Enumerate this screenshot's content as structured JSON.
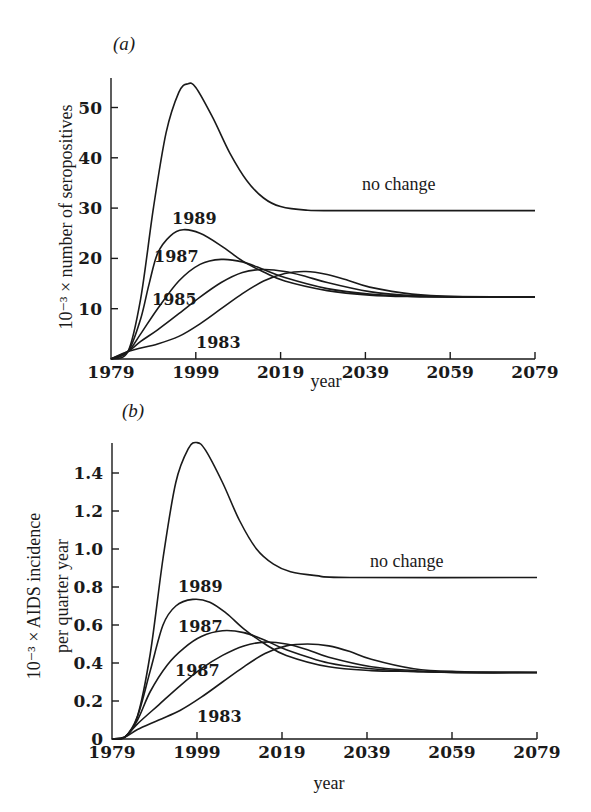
{
  "chart_data": [
    {
      "type": "line",
      "panel": "(a)",
      "title": "",
      "xlabel": "year",
      "ylabel": "10⁻³ × number of seropositives",
      "xlim": [
        1979,
        2079
      ],
      "ylim": [
        0,
        55
      ],
      "xticks": [
        1979,
        1999,
        2019,
        2039,
        2059,
        2079
      ],
      "yticks": [
        10,
        20,
        30,
        40,
        50
      ],
      "ytick_labels": [
        "10",
        "20",
        "30",
        "40",
        "50"
      ],
      "grid": false,
      "series": [
        {
          "name": "no change",
          "label_text": "no change",
          "x": [
            1979,
            1983,
            1986,
            1989,
            1992,
            1995,
            1997,
            1999,
            2003,
            2007,
            2011,
            2015,
            2019,
            2025,
            2035,
            2079
          ],
          "y": [
            0,
            1.5,
            12,
            30,
            45,
            53,
            54.7,
            54,
            48,
            41,
            35.5,
            32,
            30.3,
            29.6,
            29.5,
            29.5
          ]
        },
        {
          "name": "1989",
          "label_text": "1989",
          "x": [
            1979,
            1983,
            1986,
            1988,
            1990,
            1993,
            1996,
            2000,
            2005,
            2010,
            2015,
            2020,
            2030,
            2040,
            2050,
            2060,
            2079
          ],
          "y": [
            0,
            1.5,
            8,
            15,
            21,
            24.5,
            25.7,
            25,
            22.5,
            19.5,
            17.3,
            15.5,
            13.6,
            12.7,
            12.4,
            12.3,
            12.3
          ]
        },
        {
          "name": "1987",
          "label_text": "1987",
          "x": [
            1979,
            1983,
            1986,
            1990,
            1995,
            2000,
            2005,
            2010,
            2015,
            2020,
            2030,
            2040,
            2050,
            2060,
            2079
          ],
          "y": [
            0,
            1.5,
            5,
            10,
            15.5,
            18.8,
            19.8,
            19.3,
            17.8,
            16.2,
            14,
            12.9,
            12.5,
            12.3,
            12.3
          ]
        },
        {
          "name": "1985",
          "label_text": "1985",
          "x": [
            1979,
            1983,
            1986,
            1990,
            1995,
            2000,
            2005,
            2010,
            2015,
            2020,
            2025,
            2030,
            2040,
            2050,
            2060,
            2079
          ],
          "y": [
            0,
            1.5,
            3.5,
            5.8,
            9,
            12.3,
            15.2,
            17.2,
            17.8,
            17.4,
            16.4,
            15.2,
            13.4,
            12.6,
            12.4,
            12.3
          ]
        },
        {
          "name": "1983",
          "label_text": "1983",
          "x": [
            1979,
            1983,
            1990,
            1995,
            2000,
            2005,
            2010,
            2015,
            2020,
            2025,
            2030,
            2035,
            2040,
            2050,
            2060,
            2079
          ],
          "y": [
            0,
            1.5,
            3,
            4.5,
            7,
            10,
            13,
            15.5,
            17,
            17.4,
            16.8,
            15.6,
            14.3,
            12.9,
            12.4,
            12.3
          ]
        }
      ]
    },
    {
      "type": "line",
      "panel": "(b)",
      "title": "",
      "xlabel": "year",
      "ylabel_line1": "10⁻³ × AIDS incidence",
      "ylabel_line2": "per quarter year",
      "xlim": [
        1979,
        2079
      ],
      "ylim": [
        0,
        1.56
      ],
      "xticks": [
        1979,
        1999,
        2019,
        2039,
        2059,
        2079
      ],
      "yticks": [
        0,
        0.2,
        0.4,
        0.6,
        0.8,
        1.0,
        1.2,
        1.4
      ],
      "ytick_labels": [
        "0",
        "0.2",
        "0.4",
        "0.6",
        "0.8",
        "1.0",
        "1.2",
        "1.4"
      ],
      "grid": false,
      "series": [
        {
          "name": "no change",
          "label_text": "no change",
          "x": [
            1979,
            1982,
            1985,
            1988,
            1991,
            1994,
            1997,
            1999,
            2001,
            2005,
            2009,
            2013,
            2017,
            2021,
            2027,
            2035,
            2079
          ],
          "y": [
            0,
            0.01,
            0.12,
            0.45,
            0.95,
            1.35,
            1.53,
            1.56,
            1.52,
            1.35,
            1.15,
            1.0,
            0.92,
            0.88,
            0.86,
            0.85,
            0.85
          ]
        },
        {
          "name": "1989",
          "label_text": "1989",
          "x": [
            1979,
            1982,
            1985,
            1988,
            1991,
            1994,
            1998,
            2002,
            2006,
            2010,
            2015,
            2020,
            2030,
            2040,
            2050,
            2060,
            2079
          ],
          "y": [
            0,
            0.01,
            0.12,
            0.36,
            0.6,
            0.7,
            0.735,
            0.72,
            0.66,
            0.58,
            0.5,
            0.44,
            0.38,
            0.36,
            0.355,
            0.35,
            0.35
          ]
        },
        {
          "name": "1987",
          "label_text": "1987",
          "x": [
            1979,
            1982,
            1985,
            1988,
            1992,
            1996,
            2000,
            2005,
            2010,
            2015,
            2020,
            2030,
            2040,
            2050,
            2060,
            2079
          ],
          "y": [
            0,
            0.01,
            0.1,
            0.25,
            0.39,
            0.48,
            0.54,
            0.57,
            0.56,
            0.52,
            0.47,
            0.4,
            0.37,
            0.355,
            0.35,
            0.35
          ]
        },
        {
          "name": "1985",
          "label_text": "1987",
          "x": [
            1979,
            1982,
            1985,
            1990,
            1995,
            2000,
            2005,
            2010,
            2015,
            2020,
            2025,
            2030,
            2040,
            2050,
            2060,
            2079
          ],
          "y": [
            0,
            0.01,
            0.08,
            0.18,
            0.28,
            0.37,
            0.44,
            0.49,
            0.51,
            0.5,
            0.47,
            0.43,
            0.38,
            0.36,
            0.35,
            0.35
          ]
        },
        {
          "name": "1983",
          "label_text": "1983",
          "x": [
            1979,
            1982,
            1985,
            1990,
            1995,
            2000,
            2005,
            2010,
            2015,
            2020,
            2025,
            2030,
            2035,
            2040,
            2050,
            2060,
            2079
          ],
          "y": [
            0,
            0.01,
            0.05,
            0.1,
            0.15,
            0.22,
            0.3,
            0.38,
            0.45,
            0.49,
            0.5,
            0.49,
            0.46,
            0.42,
            0.37,
            0.355,
            0.35
          ]
        }
      ]
    }
  ],
  "layout": {
    "panels": [
      {
        "x0": 111,
        "x1": 535,
        "y0": 359,
        "pxPerUnit": 5.03,
        "axisTop": 78,
        "panelLabelPos": [
          113,
          50
        ],
        "yTitlePos": [
          72,
          217
        ],
        "xTitlePos": [
          326,
          387
        ],
        "labels": {
          "no change": [
            362,
            190
          ],
          "1989": [
            172,
            224
          ],
          "1987": [
            154,
            262
          ],
          "1985": [
            152,
            305
          ],
          "1983": [
            196,
            348
          ]
        }
      },
      {
        "x0": 112,
        "x1": 537,
        "y0": 739,
        "pxPerUnit": 190,
        "axisTop": 443,
        "panelLabelPos": [
          122,
          417
        ],
        "yTitlePos": [
          40,
          596
        ],
        "yTitle2Pos": [
          68,
          596
        ],
        "xTitlePos": [
          329,
          789
        ],
        "labels": {
          "no change": [
            370,
            567
          ],
          "1989": [
            178,
            592
          ],
          "1987": [
            178,
            632
          ],
          "1985": [
            175,
            676
          ],
          "1983": [
            197,
            722
          ]
        }
      }
    ]
  }
}
